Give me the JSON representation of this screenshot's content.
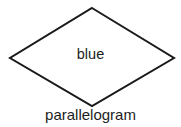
{
  "diagram": {
    "kind": "geometric-shape-diagram",
    "background_color": "#ffffff",
    "stroke_color": "#1a1a1a",
    "stroke_width_px": 2,
    "text_color": "#1d1d1d",
    "shape": {
      "icon_name": "rhombus-outline",
      "vertices": {
        "top": {
          "x": 92,
          "y": 8
        },
        "right": {
          "x": 174,
          "y": 58
        },
        "bottom": {
          "x": 92,
          "y": 106
        },
        "left": {
          "x": 10,
          "y": 58
        }
      },
      "points_attr": "92,8 174,58 92,106 10,58"
    },
    "inner_label": "blue",
    "shape_name_label": "parallelogram"
  }
}
